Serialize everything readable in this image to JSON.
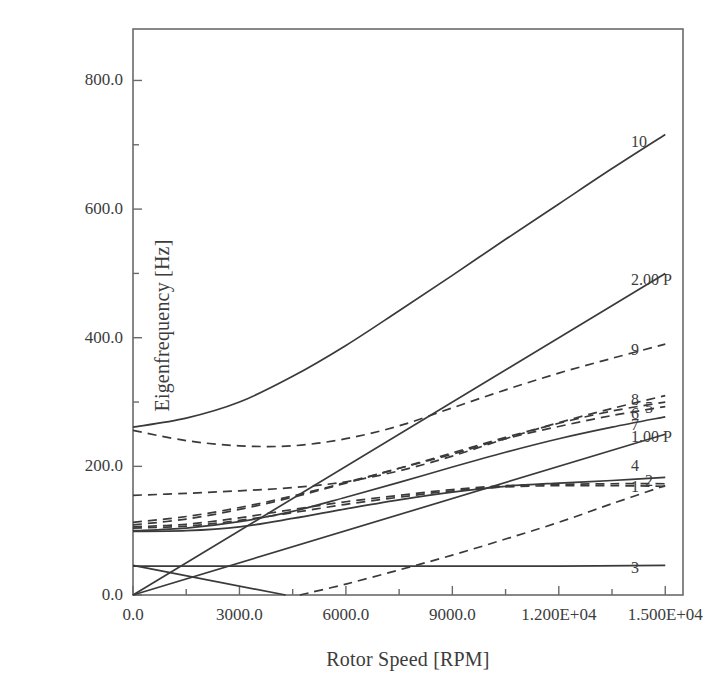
{
  "chart_data": {
    "type": "line",
    "title": "",
    "xlabel": "Rotor Speed [RPM]",
    "ylabel": "Eigenfrequency [Hz]",
    "xlim": [
      0,
      15500
    ],
    "ylim": [
      0,
      880
    ],
    "grid": false,
    "legend_position": "right-inline-labels",
    "xticks": [
      0,
      3000,
      6000,
      9000,
      12000,
      15000
    ],
    "xticklabels": [
      "0.0",
      "3000.0",
      "6000.0",
      "9000.0",
      "1.200E+04",
      "1.500E+04"
    ],
    "xminorticks": [
      1500,
      4500,
      7500,
      10500,
      13500
    ],
    "yticks": [
      0,
      200,
      400,
      600,
      800
    ],
    "yticklabels": [
      "0.0",
      "200.0",
      "400.0",
      "600.0",
      "800.0"
    ],
    "yminorticks": [
      100,
      300,
      500,
      700
    ],
    "series": [
      {
        "name": "1",
        "label": "1",
        "style": "dashed",
        "color": "#3a3a3a",
        "points": [
          [
            0,
            104
          ],
          [
            1500,
            107
          ],
          [
            3000,
            116
          ],
          [
            4500,
            128
          ],
          [
            6000,
            141
          ],
          [
            7500,
            152
          ],
          [
            9000,
            162
          ],
          [
            10500,
            168
          ],
          [
            12000,
            170
          ],
          [
            13500,
            170
          ],
          [
            15000,
            169
          ]
        ]
      },
      {
        "name": "2",
        "label": "2",
        "style": "dashed",
        "color": "#3a3a3a",
        "points": [
          [
            0,
            106
          ],
          [
            1500,
            110
          ],
          [
            3000,
            120
          ],
          [
            4500,
            133
          ],
          [
            6000,
            145
          ],
          [
            7500,
            155
          ],
          [
            9000,
            164
          ],
          [
            10500,
            170
          ],
          [
            12000,
            172
          ],
          [
            13500,
            173
          ],
          [
            15000,
            173
          ]
        ]
      },
      {
        "name": "3",
        "label": "3",
        "style": "solid",
        "color": "#3a3a3a",
        "points": [
          [
            0,
            45
          ],
          [
            3000,
            45
          ],
          [
            6000,
            45
          ],
          [
            9000,
            45
          ],
          [
            12000,
            45
          ],
          [
            15000,
            46
          ]
        ]
      },
      {
        "name": "4",
        "label": "4",
        "style": "solid",
        "color": "#3a3a3a",
        "points": [
          [
            0,
            99
          ],
          [
            1500,
            100
          ],
          [
            3000,
            106
          ],
          [
            4500,
            119
          ],
          [
            6000,
            134
          ],
          [
            7500,
            148
          ],
          [
            9000,
            160
          ],
          [
            10500,
            169
          ],
          [
            12000,
            174
          ],
          [
            13500,
            178
          ],
          [
            15000,
            183
          ]
        ]
      },
      {
        "name": "5",
        "label": "5",
        "style": "dashed",
        "color": "#3a3a3a",
        "points": [
          [
            0,
            113
          ],
          [
            1500,
            122
          ],
          [
            3000,
            136
          ],
          [
            4500,
            154
          ],
          [
            6000,
            175
          ],
          [
            7500,
            197
          ],
          [
            9000,
            219
          ],
          [
            10500,
            243
          ],
          [
            12000,
            262
          ],
          [
            13500,
            279
          ],
          [
            15000,
            293
          ]
        ]
      },
      {
        "name": "6",
        "label": "6",
        "style": "dashed",
        "color": "#3a3a3a",
        "points": [
          [
            0,
            109
          ],
          [
            1500,
            118
          ],
          [
            3000,
            133
          ],
          [
            4500,
            152
          ],
          [
            6000,
            174
          ],
          [
            7500,
            197
          ],
          [
            9000,
            221
          ],
          [
            10500,
            245
          ],
          [
            12000,
            267
          ],
          [
            13500,
            286
          ],
          [
            15000,
            300
          ]
        ]
      },
      {
        "name": "7",
        "label": "7",
        "style": "solid",
        "color": "#3a3a3a",
        "points": [
          [
            0,
            100
          ],
          [
            1500,
            104
          ],
          [
            3000,
            114
          ],
          [
            4500,
            130
          ],
          [
            6000,
            152
          ],
          [
            7500,
            175
          ],
          [
            9000,
            199
          ],
          [
            10500,
            222
          ],
          [
            12000,
            243
          ],
          [
            13500,
            261
          ],
          [
            15000,
            277
          ]
        ]
      },
      {
        "name": "8",
        "label": "8",
        "style": "dashed",
        "color": "#3a3a3a",
        "points": [
          [
            0,
            155
          ],
          [
            1500,
            158
          ],
          [
            3000,
            162
          ],
          [
            4500,
            167
          ],
          [
            6000,
            176
          ],
          [
            7500,
            193
          ],
          [
            9000,
            216
          ],
          [
            10500,
            243
          ],
          [
            12000,
            268
          ],
          [
            13500,
            290
          ],
          [
            15000,
            310
          ]
        ]
      },
      {
        "name": "9",
        "label": "9",
        "style": "dashed",
        "color": "#3a3a3a",
        "points": [
          [
            0,
            256
          ],
          [
            1500,
            240
          ],
          [
            3000,
            232
          ],
          [
            4500,
            232
          ],
          [
            6000,
            243
          ],
          [
            7500,
            263
          ],
          [
            9000,
            291
          ],
          [
            10500,
            319
          ],
          [
            12000,
            345
          ],
          [
            13500,
            368
          ],
          [
            15000,
            390
          ]
        ]
      },
      {
        "name": "10",
        "label": "10",
        "style": "solid",
        "color": "#3a3a3a",
        "points": [
          [
            0,
            261
          ],
          [
            1500,
            275
          ],
          [
            3000,
            300
          ],
          [
            4500,
            340
          ],
          [
            6000,
            388
          ],
          [
            7500,
            442
          ],
          [
            9000,
            497
          ],
          [
            10500,
            553
          ],
          [
            12000,
            608
          ],
          [
            13500,
            663
          ],
          [
            15000,
            716
          ]
        ]
      },
      {
        "name": "1.00 P",
        "label": "1.00 P",
        "style": "solid",
        "color": "#3a3a3a",
        "points": [
          [
            0,
            0
          ],
          [
            15000,
            250
          ]
        ]
      },
      {
        "name": "2.00 P",
        "label": "2.00 P",
        "style": "solid",
        "color": "#3a3a3a",
        "points": [
          [
            0,
            0
          ],
          [
            15000,
            500
          ]
        ]
      },
      {
        "name": "descending-mode",
        "label": "",
        "style": "solid",
        "color": "#3a3a3a",
        "points": [
          [
            0,
            46
          ],
          [
            4300,
            0
          ]
        ]
      },
      {
        "name": "rising-dashed-low",
        "label": "",
        "style": "dashed",
        "color": "#3a3a3a",
        "points": [
          [
            4700,
            0
          ],
          [
            6000,
            17
          ],
          [
            7500,
            39
          ],
          [
            9000,
            62
          ],
          [
            10500,
            87
          ],
          [
            12000,
            113
          ],
          [
            13500,
            142
          ],
          [
            15000,
            170
          ]
        ]
      }
    ],
    "curve_labels": [
      {
        "text": "10",
        "x": 15000,
        "y": 716
      },
      {
        "text": "2.00 P",
        "x": 15000,
        "y": 500
      },
      {
        "text": "9",
        "x": 15000,
        "y": 390
      },
      {
        "text": "8",
        "x": 15000,
        "y": 310
      },
      {
        "text": "5",
        "x": 15000,
        "y": 293
      },
      {
        "text": "6",
        "x": 15000,
        "y": 300
      },
      {
        "text": "7",
        "x": 15000,
        "y": 277
      },
      {
        "text": "1.00 P",
        "x": 15000,
        "y": 250
      },
      {
        "text": "4",
        "x": 15000,
        "y": 183
      },
      {
        "text": "2",
        "x": 15000,
        "y": 173
      },
      {
        "text": "1",
        "x": 15000,
        "y": 169
      },
      {
        "text": "3",
        "x": 15000,
        "y": 46
      }
    ]
  },
  "colors": {
    "line": "#3a3a3a",
    "axis": "#6a6a6a",
    "text": "#3c3c3c",
    "background": "#ffffff"
  },
  "geometry": {
    "plot_left": 133,
    "plot_right": 683,
    "plot_top": 29,
    "plot_bottom": 595
  },
  "curve_label_positions": [
    {
      "text": "10",
      "left": 631,
      "top": 142
    },
    {
      "text": "2.00 P",
      "left": 631,
      "top": 280
    },
    {
      "text": "9",
      "left": 631,
      "top": 350
    },
    {
      "text": "8",
      "left": 631,
      "top": 400
    },
    {
      "text": "5",
      "left": 645,
      "top": 408
    },
    {
      "text": "6",
      "left": 631,
      "top": 414
    },
    {
      "text": "7",
      "left": 631,
      "top": 425
    },
    {
      "text": "1.00 P",
      "left": 631,
      "top": 437
    },
    {
      "text": "4",
      "left": 631,
      "top": 466
    },
    {
      "text": "2",
      "left": 645,
      "top": 481
    },
    {
      "text": "1",
      "left": 631,
      "top": 487
    },
    {
      "text": "3",
      "left": 631,
      "top": 568
    }
  ]
}
